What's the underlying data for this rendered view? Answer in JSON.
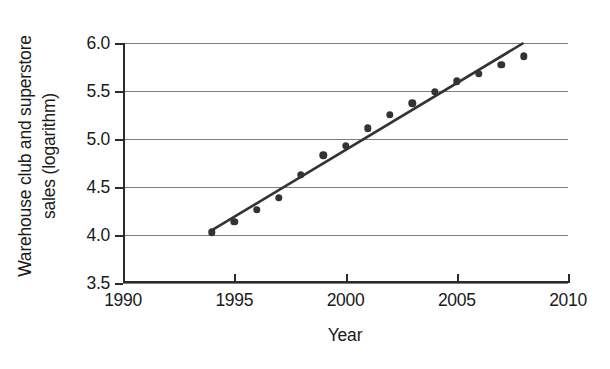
{
  "chart_data": {
    "type": "scatter",
    "title": "",
    "xlabel": "Year",
    "ylabel": "Warehouse club and superstore\nsales (logarithm)",
    "xlim": [
      1990,
      2010
    ],
    "ylim": [
      3.5,
      6.0
    ],
    "xticks": [
      1990,
      1995,
      2000,
      2005,
      2010
    ],
    "xtick_labels": [
      "1990",
      "1995",
      "2000",
      "2005",
      "2010"
    ],
    "yticks": [
      3.5,
      4.0,
      4.5,
      5.0,
      5.5,
      6.0
    ],
    "ytick_labels": [
      "3.5",
      "4.0",
      "4.5",
      "5.0",
      "5.5",
      "6.0"
    ],
    "grid": "horizontal",
    "legend": null,
    "marker_color": "#333333",
    "line_color": "#333333",
    "grid_color": "#7d7d7d",
    "axis_color": "#2b2b2b",
    "x": [
      1994,
      1995,
      1996,
      1997,
      1998,
      1999,
      2000,
      2001,
      2002,
      2003,
      2004,
      2005,
      2006,
      2007,
      2008
    ],
    "values": [
      4.03,
      4.14,
      4.26,
      4.39,
      4.63,
      4.83,
      4.93,
      5.11,
      5.25,
      5.37,
      5.49,
      5.6,
      5.68,
      5.77,
      5.86
    ],
    "series": [
      {
        "name": "Warehouse club and superstore sales (logarithm)",
        "type": "scatter",
        "values": [
          4.03,
          4.14,
          4.26,
          4.39,
          4.63,
          4.83,
          4.93,
          5.11,
          5.25,
          5.37,
          5.49,
          5.6,
          5.68,
          5.77,
          5.86
        ]
      },
      {
        "name": "Trend line",
        "type": "line",
        "x": [
          1994,
          2008
        ],
        "values": [
          4.05,
          6.0
        ]
      }
    ],
    "annotations": []
  }
}
